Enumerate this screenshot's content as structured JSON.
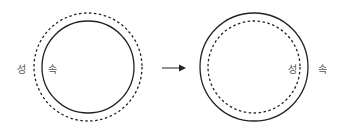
{
  "diagram": {
    "left": {
      "outer_label": "성",
      "inner_label": "속",
      "outer_style": "dashed",
      "inner_style": "solid"
    },
    "arrow": "right-arrow",
    "right": {
      "outer_label": "속",
      "inner_label": "성",
      "outer_style": "solid",
      "inner_style": "dashed"
    },
    "colors": {
      "stroke": "#222222",
      "label": "#555555"
    }
  }
}
